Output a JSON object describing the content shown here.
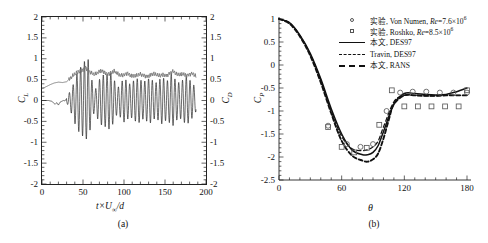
{
  "figure": {
    "panel_a": {
      "caption": "(a)",
      "xlabel_html": "t×U<sub>∞</sub>/d",
      "ylabel_left": "C",
      "ylabel_left_sub": "L",
      "ylabel_right": "C",
      "ylabel_right_sub": "D",
      "yticks": [
        "2",
        "1.5",
        "1",
        "0.5",
        "0",
        "-0.5",
        "-1",
        "-1.5",
        "-2"
      ],
      "yticks_right": [
        "2",
        "1.5",
        "1",
        "0.5",
        "0",
        "-0.5",
        "-1",
        "-1.5",
        "-2"
      ],
      "xticks": [
        "0",
        "50",
        "100",
        "150",
        "200"
      ]
    },
    "panel_b": {
      "caption": "(b)",
      "xlabel": "θ",
      "ylabel": "C",
      "ylabel_sub": "P",
      "yticks": [
        "1",
        "0.5",
        "0",
        "-0.5",
        "-1",
        "-1.5",
        "-2",
        "-2.5"
      ],
      "xticks": [
        "0",
        "60",
        "120",
        "180"
      ],
      "legend": [
        {
          "symbol": "circle-marker",
          "text_cn": "实验",
          "text_rest": ", Von Numen, ",
          "re_label": "Re",
          "re_value": "=7.6×10",
          "re_exp": "6"
        },
        {
          "symbol": "square-marker",
          "text_cn": "实验",
          "text_rest": ", Roshko, ",
          "re_label": "Re",
          "re_value": "=8.5×10",
          "re_exp": "6"
        },
        {
          "symbol": "solid-line",
          "text_cn": "本文",
          "text_rest": ", DES97",
          "re_label": "",
          "re_value": "",
          "re_exp": ""
        },
        {
          "symbol": "dashed-line",
          "text_cn": "",
          "text_rest": "Travin, DES97",
          "re_label": "",
          "re_value": "",
          "re_exp": ""
        },
        {
          "symbol": "bold-dashed-line",
          "text_cn": "本文",
          "text_rest": ", RANS",
          "re_label": "",
          "re_value": "",
          "re_exp": ""
        }
      ]
    }
  },
  "chart_data": [
    {
      "type": "line",
      "panel": "a",
      "title": "",
      "xlabel": "t×U∞/d",
      "ylabel": "C_L (left), C_D (right)",
      "xlim": [
        0,
        200
      ],
      "ylim": [
        -2,
        2
      ],
      "xticks": [
        0,
        50,
        100,
        150,
        200
      ],
      "yticks": [
        -2,
        -1.5,
        -1,
        -0.5,
        0,
        0.5,
        1,
        1.5,
        2
      ],
      "grid": false,
      "legend_position": "none",
      "series": [
        {
          "name": "C_L",
          "color": "#1a1a1a",
          "description": "Lift coefficient time history: flat near 0 until t≈32, then growing vortex-shedding oscillation reaching peak amplitude ≈±1.0 at t≈55, settling to irregular amplitude ≈±0.55 with beating",
          "x": [
            0,
            4,
            8,
            12,
            16,
            18,
            20,
            22,
            24,
            26,
            28,
            30,
            32,
            34,
            36,
            38,
            40,
            42,
            44,
            46,
            48,
            50,
            52,
            54,
            56,
            58,
            60,
            62,
            64,
            66,
            68,
            70,
            72,
            74,
            76,
            78,
            80,
            82,
            84,
            86,
            88,
            90,
            92,
            94,
            96,
            98,
            100,
            102,
            104,
            106,
            108,
            110,
            112,
            114,
            116,
            118,
            120,
            122,
            124,
            126,
            128,
            130,
            132,
            134,
            136,
            138,
            140,
            142,
            144,
            146,
            148,
            150,
            152,
            154,
            156,
            158,
            160,
            162,
            164,
            166,
            168,
            170,
            172,
            174,
            176,
            178,
            180,
            182,
            184,
            186,
            188
          ],
          "y": [
            0,
            0,
            0,
            -0.02,
            -0.09,
            -0.05,
            -0.11,
            -0.04,
            -0.02,
            0,
            -0.01,
            0.05,
            -0.13,
            0.22,
            -0.32,
            0.38,
            -0.55,
            0.62,
            -0.72,
            0.78,
            -0.82,
            0.86,
            -0.95,
            0.92,
            -1.02,
            0.78,
            -0.55,
            0.42,
            -0.25,
            0.3,
            -0.45,
            0.5,
            -0.58,
            0.62,
            -0.6,
            0.66,
            -0.62,
            0.7,
            -0.66,
            0.58,
            -0.5,
            0.4,
            -0.3,
            0.35,
            -0.42,
            0.48,
            -0.52,
            0.5,
            -0.46,
            0.42,
            -0.38,
            0.44,
            -0.48,
            0.5,
            -0.52,
            0.54,
            -0.5,
            0.46,
            -0.44,
            0.48,
            -0.5,
            0.52,
            -0.54,
            0.5,
            -0.46,
            0.42,
            -0.44,
            0.48,
            -0.52,
            0.56,
            -0.54,
            0.5,
            -0.46,
            0.5,
            -0.55,
            0.68,
            -0.6,
            0.52,
            -0.48,
            0.44,
            -0.42,
            0.46,
            -0.5,
            0.54,
            -0.58,
            0.55,
            -0.5,
            0.45,
            -0.4,
            0.35,
            -0.25
          ]
        },
        {
          "name": "C_D",
          "color": "#777777",
          "description": "Drag coefficient time history (plotted on right axis): rises from ≈0.28 at t=0 to ≈0.45 plateau, jumps to ≈0.8 peak near t≈53, then fluctuates irregularly about ≈0.6-0.65",
          "x": [
            0,
            5,
            10,
            15,
            20,
            25,
            30,
            34,
            38,
            42,
            46,
            50,
            53,
            56,
            60,
            64,
            68,
            72,
            76,
            80,
            84,
            88,
            92,
            96,
            100,
            104,
            108,
            112,
            116,
            120,
            124,
            128,
            132,
            136,
            140,
            144,
            148,
            152,
            156,
            160,
            164,
            168,
            172,
            176,
            180,
            184,
            188
          ],
          "y": [
            0.28,
            0.33,
            0.38,
            0.42,
            0.44,
            0.43,
            0.45,
            0.52,
            0.6,
            0.66,
            0.7,
            0.74,
            0.8,
            0.72,
            0.66,
            0.62,
            0.66,
            0.72,
            0.68,
            0.63,
            0.66,
            0.7,
            0.64,
            0.6,
            0.62,
            0.66,
            0.6,
            0.58,
            0.6,
            0.63,
            0.6,
            0.58,
            0.61,
            0.64,
            0.61,
            0.59,
            0.62,
            0.6,
            0.66,
            0.7,
            0.63,
            0.61,
            0.64,
            0.6,
            0.63,
            0.65,
            0.57
          ]
        }
      ]
    },
    {
      "type": "line",
      "panel": "b",
      "title": "",
      "xlabel": "θ",
      "ylabel": "C_P",
      "xlim": [
        0,
        180
      ],
      "ylim": [
        -2.5,
        1
      ],
      "xticks": [
        0,
        60,
        120,
        180
      ],
      "yticks": [
        -2.5,
        -2,
        -1.5,
        -1,
        -0.5,
        0,
        0.5,
        1
      ],
      "grid": false,
      "legend_position": "top-right",
      "series": [
        {
          "name": "实验, Von Numen, Re=7.6×10^6",
          "type": "scatter",
          "marker": "circle",
          "x": [
            47,
            65,
            78,
            90,
            103,
            116,
            128,
            141,
            154,
            167,
            180
          ],
          "y": [
            -1.32,
            -1.72,
            -1.78,
            -1.72,
            -1.0,
            -0.6,
            -0.58,
            -0.58,
            -0.6,
            -0.6,
            -0.6
          ]
        },
        {
          "name": "实验, Roshko, Re=8.5×10^6",
          "type": "scatter",
          "marker": "square",
          "x": [
            47,
            60,
            72,
            84,
            96,
            108,
            120,
            133,
            146,
            159,
            172,
            180
          ],
          "y": [
            -1.35,
            -1.78,
            -1.9,
            -1.8,
            -1.3,
            -0.55,
            -0.9,
            -0.9,
            -0.9,
            -0.9,
            -0.9,
            -0.55
          ]
        },
        {
          "name": "本文, DES97",
          "type": "line",
          "style": "solid",
          "x": [
            0,
            10,
            20,
            30,
            40,
            50,
            60,
            70,
            80,
            85,
            90,
            95,
            100,
            110,
            120,
            130,
            140,
            150,
            160,
            170,
            180
          ],
          "y": [
            1.0,
            0.92,
            0.65,
            0.25,
            -0.3,
            -0.95,
            -1.5,
            -1.85,
            -1.95,
            -1.95,
            -1.9,
            -1.75,
            -1.45,
            -0.85,
            -0.62,
            -0.62,
            -0.64,
            -0.65,
            -0.64,
            -0.58,
            -0.5
          ]
        },
        {
          "name": "Travin, DES97",
          "type": "line",
          "style": "dashed",
          "x": [
            0,
            10,
            20,
            30,
            40,
            50,
            60,
            70,
            80,
            85,
            90,
            95,
            100,
            110,
            120,
            130,
            140,
            150,
            160,
            170,
            180
          ],
          "y": [
            1.0,
            0.92,
            0.64,
            0.23,
            -0.33,
            -1.0,
            -1.55,
            -1.82,
            -1.86,
            -1.84,
            -1.78,
            -1.65,
            -1.35,
            -0.8,
            -0.66,
            -0.66,
            -0.67,
            -0.67,
            -0.66,
            -0.66,
            -0.66
          ]
        },
        {
          "name": "本文, RANS",
          "type": "line",
          "style": "bold-dashed",
          "x": [
            0,
            10,
            20,
            30,
            40,
            50,
            60,
            70,
            80,
            85,
            90,
            95,
            100,
            105,
            110,
            120,
            130,
            140,
            150,
            160,
            170,
            180
          ],
          "y": [
            1.0,
            0.9,
            0.62,
            0.2,
            -0.38,
            -1.05,
            -1.65,
            -1.97,
            -2.08,
            -2.1,
            -2.05,
            -1.92,
            -1.6,
            -1.2,
            -0.85,
            -0.66,
            -0.66,
            -0.67,
            -0.67,
            -0.66,
            -0.66,
            -0.66
          ]
        }
      ]
    }
  ]
}
